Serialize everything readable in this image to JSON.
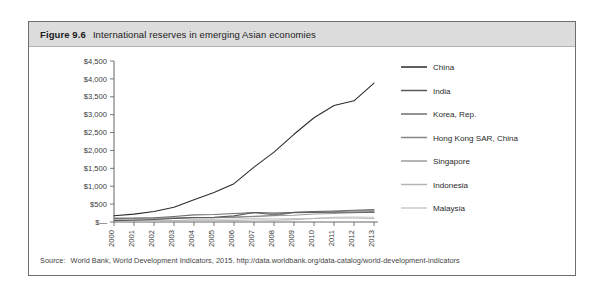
{
  "figure": {
    "number": "Figure 9.6",
    "title": "International reserves in emerging Asian economies"
  },
  "source": {
    "label": "Source:",
    "text": "World Bank, World Development Indicators, 2015. http://data.worldbank.org/data-catalog/world-development-indicators"
  },
  "colors": {
    "card_border": "#6e6e6e",
    "title_band": "#dcdcdc",
    "axis": "#555555",
    "china": "#2b2b2b",
    "india": "#5a5a5a",
    "korea": "#6f6f6f",
    "hongkong": "#858585",
    "singapore": "#9c9c9c",
    "indonesia": "#b4b4b4",
    "malaysia": "#cbcbcb"
  },
  "chart_data": {
    "type": "line",
    "title": "International reserves in emerging Asian economies",
    "xlabel": "",
    "ylabel": "",
    "ylim": [
      0,
      4500
    ],
    "grid": false,
    "legend_position": "right",
    "x": [
      "2000",
      "2001",
      "2002",
      "2003",
      "2004",
      "2005",
      "2006",
      "2007",
      "2008",
      "2009",
      "2010",
      "2011",
      "2012",
      "2013"
    ],
    "ytick_labels": [
      "$4,500",
      "$4,000",
      "$3,500",
      "$3,000",
      "$2,500",
      "$2,000",
      "$1,500",
      "$1,000",
      "$500",
      "$—"
    ],
    "ytick_values": [
      4500,
      4000,
      3500,
      3000,
      2500,
      2000,
      1500,
      1000,
      500,
      0
    ],
    "series": [
      {
        "name": "China",
        "color": "#2b2b2b",
        "values": [
          172,
          220,
          296,
          412,
          623,
          826,
          1072,
          1534,
          1953,
          2452,
          2914,
          3256,
          3388,
          3880
        ]
      },
      {
        "name": "India",
        "color": "#5a5a5a",
        "values": [
          38,
          46,
          68,
          99,
          127,
          132,
          171,
          267,
          248,
          266,
          276,
          271,
          271,
          276
        ]
      },
      {
        "name": "Korea, Rep.",
        "color": "#6f6f6f",
        "values": [
          96,
          102,
          121,
          155,
          199,
          210,
          239,
          262,
          201,
          270,
          292,
          307,
          327,
          346
        ]
      },
      {
        "name": "Hong Kong SAR, China",
        "color": "#858585",
        "values": [
          108,
          111,
          112,
          118,
          124,
          124,
          133,
          153,
          183,
          256,
          269,
          285,
          317,
          311
        ]
      },
      {
        "name": "Singapore",
        "color": "#9c9c9c",
        "values": [
          80,
          75,
          82,
          96,
          113,
          116,
          136,
          163,
          174,
          188,
          226,
          238,
          259,
          273
        ]
      },
      {
        "name": "Indonesia",
        "color": "#b4b4b4",
        "values": [
          29,
          28,
          32,
          36,
          36,
          35,
          43,
          57,
          51,
          66,
          96,
          110,
          113,
          99
        ]
      },
      {
        "name": "Malaysia",
        "color": "#cbcbcb",
        "values": [
          29,
          30,
          34,
          44,
          66,
          70,
          82,
          102,
          92,
          96,
          106,
          133,
          139,
          134
        ]
      }
    ]
  }
}
